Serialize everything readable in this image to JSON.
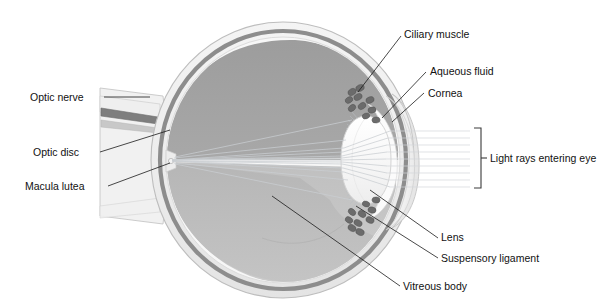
{
  "figure": {
    "type": "anatomical-diagram",
    "background_color": "#ffffff",
    "text_color": "#111111",
    "leader_line_color": "#1a1a1a"
  },
  "labels": {
    "optic_nerve": "Optic nerve",
    "optic_disc": "Optic disc",
    "macula_lutea": "Macula lutea",
    "ciliary_muscle": "Ciliary muscle",
    "aqueous_fluid": "Aqueous fluid",
    "cornea": "Cornea",
    "light_rays": "Light rays entering eye",
    "lens": "Lens",
    "suspensory_ligament": "Suspensory ligament",
    "vitreous_body": "Vitreous body"
  },
  "palette": {
    "sclera": "#efefef",
    "sclera_edge": "#c9c9c9",
    "choroid": "#8f8f8f",
    "retina": "#f6f6f6",
    "vitreous_upper": "#a3a3a3",
    "vitreous_lower": "#b8b8b8",
    "lens": "#fbfbfb",
    "lens_edge": "#d8d8d8",
    "cornea": "#f2f2f2",
    "aqueous": "#fafafa",
    "ciliary_dots": "#6e6e6e",
    "nerve_band": "#8a8a8a",
    "ray": "#c9cdd2"
  },
  "structures": [
    {
      "name": "sclera",
      "description": "outer pale fibrous coat"
    },
    {
      "name": "choroid",
      "description": "dark grey vascular middle band"
    },
    {
      "name": "retina",
      "description": "pale inner lining"
    },
    {
      "name": "vitreous body",
      "description": "large grey posterior chamber"
    },
    {
      "name": "lens",
      "description": "biconvex pale ellipse"
    },
    {
      "name": "cornea",
      "description": "transparent anterior dome"
    },
    {
      "name": "aqueous fluid",
      "description": "anterior chamber"
    },
    {
      "name": "ciliary muscle",
      "description": "clustered dark cells at lens equator"
    },
    {
      "name": "suspensory ligament",
      "description": "fine zonule fibres to lens"
    },
    {
      "name": "optic nerve",
      "description": "stalk leaving posterior pole"
    },
    {
      "name": "optic disc",
      "description": "nerve head on retina"
    },
    {
      "name": "macula lutea",
      "description": "spot of sharpest vision"
    }
  ]
}
